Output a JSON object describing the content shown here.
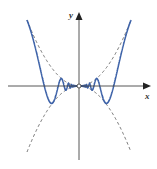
{
  "chart_data": {
    "type": "line",
    "title": "",
    "xlabel": "x",
    "ylabel": "y",
    "grid": false,
    "legend": null,
    "xlim": [
      -1,
      1
    ],
    "ylim": [
      -1,
      1
    ],
    "series": [
      {
        "name": "y = x^2 sin(1/x)-type oscillating curve",
        "style": "solid",
        "color": "#3d62a8",
        "formula": "x^2 * sin(1/x^2 style oscillation), bounded by +/- x^2"
      },
      {
        "name": "upper envelope y = x^2",
        "style": "dashed",
        "color": "#555555"
      },
      {
        "name": "lower envelope y = -x^2",
        "style": "dashed",
        "color": "#555555"
      }
    ],
    "annotations": [
      {
        "type": "open-circle",
        "x": 0,
        "y": 0
      }
    ]
  },
  "axes": {
    "x_label": "x",
    "y_label": "y"
  },
  "colors": {
    "curve": "#3d62a8",
    "envelope": "#555555",
    "axis": "#444444"
  }
}
